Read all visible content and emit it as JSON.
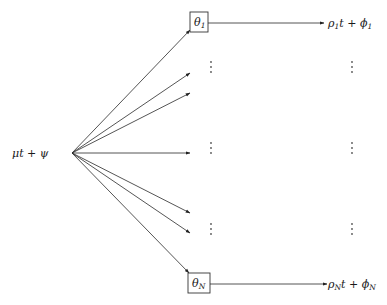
{
  "diagram": {
    "source": {
      "label": "μt + ψ"
    },
    "nodes": [
      {
        "id": "theta_1",
        "symbol": "θ",
        "subscript": "1"
      },
      {
        "id": "theta_N",
        "symbol": "θ",
        "subscript": "N"
      }
    ],
    "outputs": [
      {
        "id": "out_1",
        "parts": [
          "ρ",
          "1",
          "t + ",
          "ϕ",
          "1"
        ]
      },
      {
        "id": "out_N",
        "parts": [
          "ρ",
          "N",
          "t + ",
          "ϕ",
          "N"
        ]
      }
    ],
    "ellipsis_glyph": "⋮",
    "fan_out_arrow_count": 8
  }
}
